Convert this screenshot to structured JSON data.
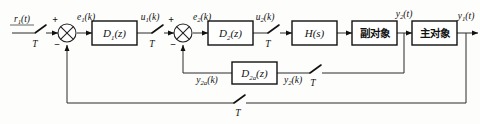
{
  "diagram": {
    "background_color": "#fdfdfb",
    "line_color": "#2b2b2b"
  },
  "blocks": [
    {
      "id": "d1",
      "label": "D",
      "sub": "1",
      "arg": "(z)",
      "kind": "transfer-function"
    },
    {
      "id": "d2",
      "label": "D",
      "sub": "2",
      "arg": "(z)",
      "kind": "transfer-function"
    },
    {
      "id": "hs",
      "label": "H",
      "sub": "",
      "arg": "(s)",
      "kind": "transfer-function"
    },
    {
      "id": "plant_secondary",
      "label": "副对象",
      "kind": "plant"
    },
    {
      "id": "plant_main",
      "label": "主对象",
      "kind": "plant"
    },
    {
      "id": "d2a",
      "label": "D",
      "sub": "2a",
      "arg": "(z)",
      "kind": "transfer-function"
    }
  ],
  "signals": {
    "input": {
      "base": "r",
      "sub": "1",
      "arg": "(t)"
    },
    "e1": {
      "base": "e",
      "sub": "1",
      "arg": "(k)"
    },
    "u1": {
      "base": "u",
      "sub": "1",
      "arg": "(k)"
    },
    "e2": {
      "base": "e",
      "sub": "2",
      "arg": "(k)"
    },
    "u2": {
      "base": "u",
      "sub": "2",
      "arg": "(k)"
    },
    "y2t": {
      "base": "y",
      "sub": "2",
      "arg": "(t)"
    },
    "y1t": {
      "base": "y",
      "sub": "1",
      "arg": "(t)"
    },
    "y2ak": {
      "base": "y",
      "sub": "2a",
      "arg": "(k)"
    },
    "y2k": {
      "base": "y",
      "sub": "2",
      "arg": "(k)"
    }
  },
  "samplers": [
    {
      "id": "sampler-input",
      "label": "T"
    },
    {
      "id": "sampler-u1",
      "label": "T"
    },
    {
      "id": "sampler-u2",
      "label": "T"
    },
    {
      "id": "sampler-inner-feedback",
      "label": "T"
    },
    {
      "id": "sampler-outer-feedback",
      "label": "T"
    }
  ],
  "summers": [
    {
      "id": "summer-outer",
      "plus": "+",
      "minus": "−"
    },
    {
      "id": "summer-inner",
      "plus": "+",
      "minus": "−"
    }
  ]
}
